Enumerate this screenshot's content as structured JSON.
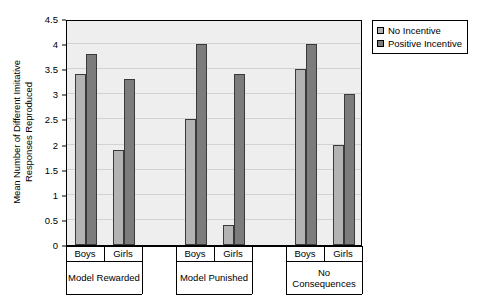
{
  "chart_data": {
    "type": "bar",
    "title": "",
    "xlabel": "",
    "ylabel_line1": "Mean Number of Different Imitative",
    "ylabel_line2": "Responses Reproduced",
    "ylim": [
      0,
      4.5
    ],
    "ytick_labels": [
      "0",
      "0.5",
      "1",
      "1.5",
      "2",
      "2.5",
      "3",
      "3.5",
      "4",
      "4.5"
    ],
    "ytick_values": [
      0,
      0.5,
      1,
      1.5,
      2,
      2.5,
      3,
      3.5,
      4,
      4.5
    ],
    "grid": true,
    "legend_position": "top-right",
    "groups": [
      "Model Rewarded",
      "Model Punished",
      "No Consequences"
    ],
    "group_labels_display": [
      {
        "line1": "Model Rewarded",
        "line2": ""
      },
      {
        "line1": "Model Punished",
        "line2": ""
      },
      {
        "line1": "No",
        "line2": "Consequences"
      }
    ],
    "categories": [
      "Model Rewarded - Boys",
      "Model Rewarded - Girls",
      "Model Punished - Boys",
      "Model Punished - Girls",
      "No Consequences - Boys",
      "No Consequences - Girls"
    ],
    "subgroup_labels": [
      "Boys",
      "Girls"
    ],
    "series": [
      {
        "name": "No Incentive",
        "color": "#b3b3b3",
        "values": [
          3.4,
          1.9,
          2.5,
          0.4,
          3.5,
          2.0
        ]
      },
      {
        "name": "Positive Incentive",
        "color": "#7c7c7c",
        "values": [
          3.8,
          3.3,
          4.0,
          3.4,
          4.0,
          3.0
        ]
      }
    ]
  },
  "legend": {
    "items": [
      {
        "label": "No Incentive",
        "swatch": "light"
      },
      {
        "label": "Positive Incentive",
        "swatch": "dark"
      }
    ]
  },
  "axis": {
    "y_title_line1": "Mean Number of Different Imitative",
    "y_title_line2": "Responses Reproduced"
  }
}
